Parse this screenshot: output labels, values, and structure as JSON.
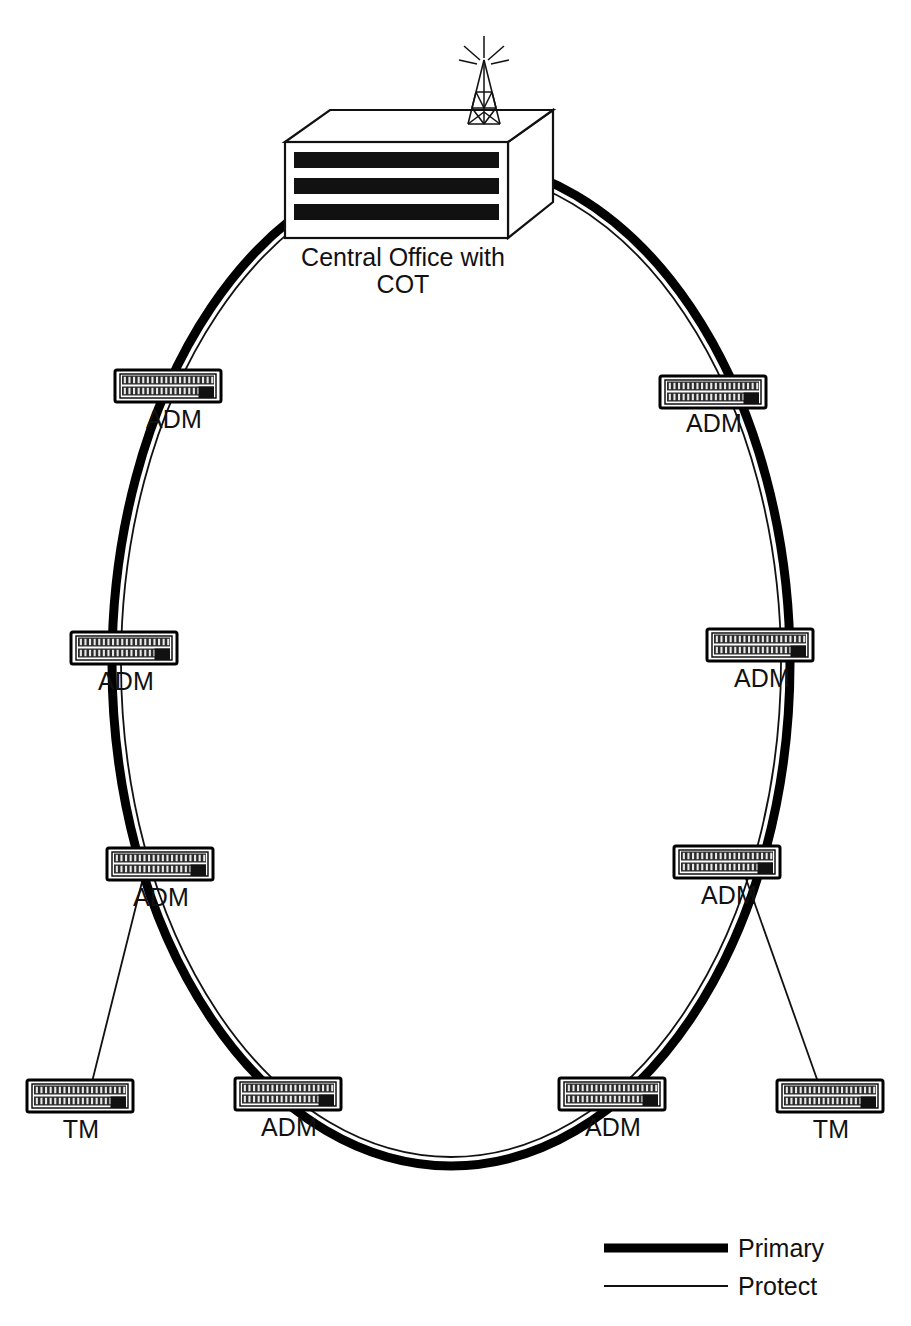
{
  "diagram": {
    "background_color": "#ffffff",
    "line_color": "#000000",
    "central_office": {
      "label_line1": "Central Office with",
      "label_line2": "COT",
      "icon": "central-office-building-icon",
      "antenna_icon": "antenna-tower-icon",
      "window_band_count": 3
    },
    "legend": {
      "items": [
        {
          "label": "Primary",
          "style": "thick",
          "stroke_width": 9,
          "color": "#000000"
        },
        {
          "label": "Protect",
          "style": "thin",
          "stroke_width": 1.6,
          "color": "#000000"
        }
      ]
    },
    "ring": {
      "primary_label": "Primary",
      "protect_label": "Protect",
      "center_x": 451,
      "center_y": 663,
      "radius_x": 339,
      "radius_y": 503
    },
    "nodes": [
      {
        "id": "adm-upper-left",
        "label": "ADM",
        "type": "ADM",
        "x": 168,
        "y": 386,
        "label_x": 174,
        "label_y": 428
      },
      {
        "id": "adm-upper-right",
        "label": "ADM",
        "type": "ADM",
        "x": 713,
        "y": 392,
        "label_x": 714,
        "label_y": 432
      },
      {
        "id": "adm-mid-left",
        "label": "ADM",
        "type": "ADM",
        "x": 124,
        "y": 648,
        "label_x": 126,
        "label_y": 690
      },
      {
        "id": "adm-mid-right",
        "label": "ADM",
        "type": "ADM",
        "x": 760,
        "y": 645,
        "label_x": 762,
        "label_y": 687
      },
      {
        "id": "adm-lower-left",
        "label": "ADM",
        "type": "ADM",
        "x": 160,
        "y": 864,
        "label_x": 161,
        "label_y": 906
      },
      {
        "id": "adm-lower-right",
        "label": "ADM",
        "type": "ADM",
        "x": 727,
        "y": 862,
        "label_x": 729,
        "label_y": 904
      },
      {
        "id": "adm-bottom-left",
        "label": "ADM",
        "type": "ADM",
        "x": 288,
        "y": 1094,
        "label_x": 289,
        "label_y": 1136
      },
      {
        "id": "adm-bottom-right",
        "label": "ADM",
        "type": "ADM",
        "x": 612,
        "y": 1094,
        "label_x": 613,
        "label_y": 1136
      },
      {
        "id": "tm-left",
        "label": "TM",
        "type": "TM",
        "x": 80,
        "y": 1096,
        "label_x": 81,
        "label_y": 1138
      },
      {
        "id": "tm-right",
        "label": "TM",
        "type": "TM",
        "x": 830,
        "y": 1096,
        "label_x": 831,
        "label_y": 1138
      }
    ],
    "spurs": [
      {
        "id": "spur-left",
        "from": "adm-lower-left",
        "to": "tm-left"
      },
      {
        "id": "spur-right",
        "from": "adm-lower-right",
        "to": "tm-right"
      }
    ]
  }
}
